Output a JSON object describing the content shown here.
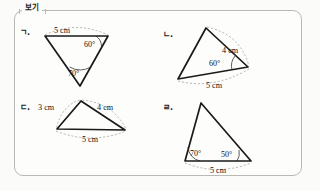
{
  "box": {
    "tab_label": "보기"
  },
  "items": [
    {
      "key": "a",
      "label": "ㄱ.",
      "sides": [
        {
          "name": "top-side",
          "text": "5 cm"
        }
      ],
      "angles": [
        {
          "name": "angle-right",
          "text": "60°"
        },
        {
          "name": "angle-bottom",
          "text": "70°"
        }
      ]
    },
    {
      "key": "b",
      "label": "ㄴ.",
      "sides": [
        {
          "name": "right-side",
          "text": "4 cm"
        },
        {
          "name": "bottom-side",
          "text": "5 cm"
        }
      ],
      "angles": [
        {
          "name": "angle-right",
          "text": "60°"
        }
      ]
    },
    {
      "key": "c",
      "label": "ㄷ.",
      "sides": [
        {
          "name": "left-side",
          "text": "3 cm"
        },
        {
          "name": "right-side",
          "text": "4 cm"
        },
        {
          "name": "bottom-side",
          "text": "5 cm"
        }
      ],
      "angles": []
    },
    {
      "key": "d",
      "label": "ㄹ.",
      "sides": [
        {
          "name": "bottom-side",
          "text": "5 cm"
        }
      ],
      "angles": [
        {
          "name": "angle-left",
          "text": "70°"
        },
        {
          "name": "angle-right",
          "text": "50°"
        }
      ]
    }
  ],
  "colors": {
    "ink": "#1a1a1a",
    "border": "#b9b9b5",
    "leader": "#9a9a96",
    "paper": "#fdfdfc"
  }
}
